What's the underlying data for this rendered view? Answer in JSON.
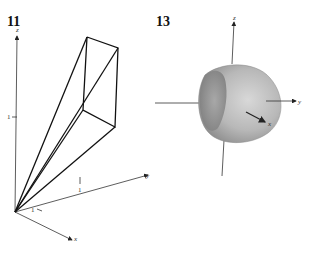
{
  "figures": [
    {
      "number": "11",
      "description": "Wireframe solid (wedge/pyramid-like) in first octant with origin vertex",
      "axes": {
        "x": "x",
        "y": "y",
        "z": "z"
      },
      "ticks": {
        "x": "1",
        "y": "1",
        "z": "1"
      }
    },
    {
      "number": "13",
      "description": "Shaded cut spherical solid (hemisphere-like shell) centered at origin",
      "axes": {
        "x": "x",
        "y": "y",
        "z": "z"
      }
    }
  ]
}
